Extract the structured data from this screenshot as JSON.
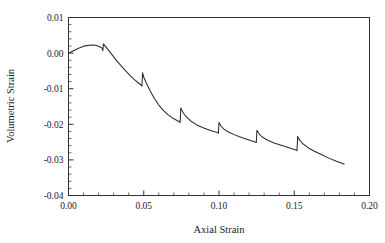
{
  "chart_data": {
    "type": "line",
    "title": "",
    "xlabel": "Axial Strain",
    "ylabel": "Volumetric Strain",
    "xlim": [
      0.0,
      0.2
    ],
    "ylim": [
      -0.04,
      0.01
    ],
    "xticks": [
      0.0,
      0.05,
      0.1,
      0.15,
      0.2
    ],
    "yticks": [
      -0.04,
      -0.03,
      -0.02,
      -0.01,
      0.0,
      0.01
    ],
    "xtick_labels": [
      "0.00",
      "0.05",
      "0.10",
      "0.15",
      "0.20"
    ],
    "ytick_labels": [
      "-0.04",
      "-0.03",
      "-0.02",
      "-0.01",
      "0.00",
      "0.01"
    ],
    "x_minor_step": 0.01,
    "y_minor_step": 0.002,
    "grid": false,
    "legend": null,
    "series": [
      {
        "name": "Volumetric Strain",
        "color": "#2b2b2b",
        "points": [
          [
            0.0,
            0.0
          ],
          [
            0.002,
            0.0004
          ],
          [
            0.004,
            0.0008
          ],
          [
            0.006,
            0.0012
          ],
          [
            0.008,
            0.0016
          ],
          [
            0.01,
            0.0019
          ],
          [
            0.012,
            0.0021
          ],
          [
            0.014,
            0.0022
          ],
          [
            0.016,
            0.00225
          ],
          [
            0.018,
            0.0022
          ],
          [
            0.02,
            0.0019
          ],
          [
            0.0215,
            0.0016
          ],
          [
            0.0225,
            0.0013
          ],
          [
            0.0228,
            0.00065
          ],
          [
            0.0232,
            0.0026
          ],
          [
            0.026,
            0.0011
          ],
          [
            0.029,
            -0.0005
          ],
          [
            0.032,
            -0.0021
          ],
          [
            0.035,
            -0.0036
          ],
          [
            0.038,
            -0.005
          ],
          [
            0.041,
            -0.0063
          ],
          [
            0.044,
            -0.0075
          ],
          [
            0.0465,
            -0.0084
          ],
          [
            0.048,
            -0.0089
          ],
          [
            0.0488,
            -0.0093
          ],
          [
            0.0492,
            -0.0055
          ],
          [
            0.05,
            -0.0068
          ],
          [
            0.052,
            -0.0087
          ],
          [
            0.0545,
            -0.0108
          ],
          [
            0.057,
            -0.0127
          ],
          [
            0.06,
            -0.0146
          ],
          [
            0.063,
            -0.0161
          ],
          [
            0.066,
            -0.0173
          ],
          [
            0.069,
            -0.0182
          ],
          [
            0.0715,
            -0.0188
          ],
          [
            0.0735,
            -0.0192
          ],
          [
            0.0742,
            -0.0195
          ],
          [
            0.0746,
            -0.0154
          ],
          [
            0.076,
            -0.0166
          ],
          [
            0.078,
            -0.0178
          ],
          [
            0.081,
            -0.019
          ],
          [
            0.085,
            -0.0201
          ],
          [
            0.089,
            -0.0209
          ],
          [
            0.093,
            -0.0215
          ],
          [
            0.0965,
            -0.022
          ],
          [
            0.099,
            -0.0223
          ],
          [
            0.0996,
            -0.0225
          ],
          [
            0.1,
            -0.0195
          ],
          [
            0.1012,
            -0.0204
          ],
          [
            0.103,
            -0.0213
          ],
          [
            0.106,
            -0.0221
          ],
          [
            0.11,
            -0.0229
          ],
          [
            0.115,
            -0.0237
          ],
          [
            0.12,
            -0.0244
          ],
          [
            0.1235,
            -0.0249
          ],
          [
            0.1248,
            -0.0251
          ],
          [
            0.1252,
            -0.0217
          ],
          [
            0.1265,
            -0.0226
          ],
          [
            0.1285,
            -0.0235
          ],
          [
            0.132,
            -0.0244
          ],
          [
            0.137,
            -0.0253
          ],
          [
            0.143,
            -0.0261
          ],
          [
            0.148,
            -0.0268
          ],
          [
            0.151,
            -0.0272
          ],
          [
            0.1518,
            -0.0274
          ],
          [
            0.1523,
            -0.0234
          ],
          [
            0.1535,
            -0.0244
          ],
          [
            0.1555,
            -0.0254
          ],
          [
            0.159,
            -0.0265
          ],
          [
            0.163,
            -0.0275
          ],
          [
            0.168,
            -0.0285
          ],
          [
            0.173,
            -0.0295
          ],
          [
            0.178,
            -0.0304
          ],
          [
            0.182,
            -0.031
          ],
          [
            0.1832,
            -0.0312
          ]
        ]
      }
    ],
    "annotations": [
      {
        "name": "stress-drop-1",
        "x": 0.023
      },
      {
        "name": "stress-drop-2",
        "x": 0.049
      },
      {
        "name": "stress-drop-3",
        "x": 0.0744
      },
      {
        "name": "stress-drop-4",
        "x": 0.0998
      },
      {
        "name": "stress-drop-5",
        "x": 0.125
      },
      {
        "name": "stress-drop-6",
        "x": 0.152
      }
    ]
  }
}
